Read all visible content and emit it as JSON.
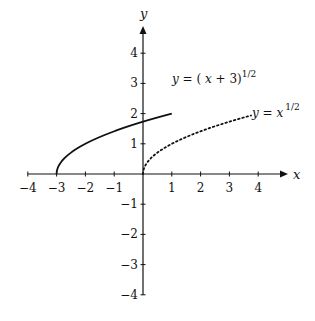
{
  "chart_data": {
    "type": "line",
    "title": "",
    "xlabel": "x",
    "ylabel": "y",
    "xlim": [
      -4,
      4.8
    ],
    "ylim": [
      -4,
      4.8
    ],
    "grid": false,
    "x_ticks": [
      -4,
      -3,
      -2,
      -1,
      1,
      2,
      3,
      4
    ],
    "x_tick_labels": [
      "−4",
      "−3",
      "−2",
      "−1",
      "1",
      "2",
      "3",
      "4"
    ],
    "y_ticks": [
      4,
      3,
      2,
      1,
      -1,
      -2,
      -3,
      -4
    ],
    "y_tick_labels": [
      "4",
      "3",
      "2",
      "1",
      "−1",
      "−2",
      "−3",
      "−4"
    ],
    "series": [
      {
        "name": "y = (x + 3)^(1/2)",
        "style": "solid",
        "x": [
          -3,
          -2.9,
          -2.75,
          -2.5,
          -2,
          -1.5,
          -1,
          -0.5,
          0,
          0.5,
          1
        ],
        "y": [
          0,
          0.316,
          0.5,
          0.707,
          1.0,
          1.225,
          1.414,
          1.581,
          1.732,
          1.871,
          2.0
        ]
      },
      {
        "name": "y = x^(1/2)",
        "style": "dotted",
        "x": [
          0,
          0.1,
          0.25,
          0.5,
          1,
          1.5,
          2,
          2.5,
          3,
          3.5,
          3.75
        ],
        "y": [
          0,
          0.316,
          0.5,
          0.707,
          1.0,
          1.225,
          1.414,
          1.581,
          1.732,
          1.871,
          1.936
        ]
      }
    ],
    "annotations": [
      {
        "text": "y = ( x + 3)^{1/2}",
        "near_series": 0
      },
      {
        "text": "y = x^{1/2}",
        "near_series": 1
      }
    ]
  },
  "labels": {
    "x_axis": "x",
    "y_axis": "y",
    "curve1": {
      "lhs": "y",
      "eq": " = ( ",
      "var": "x",
      "rest": " + 3)",
      "exp": "1/2"
    },
    "curve2": {
      "lhs": "y",
      "eq": " = ",
      "var": "x",
      "exp": "1/2"
    }
  }
}
